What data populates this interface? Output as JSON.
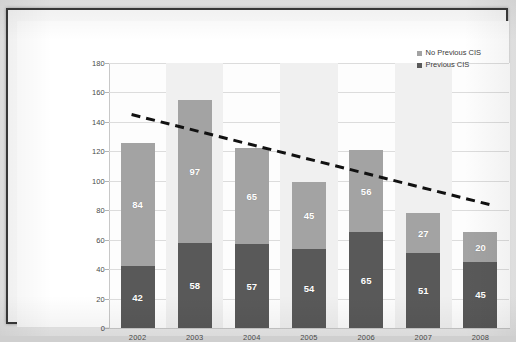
{
  "chart_data": {
    "type": "bar",
    "stacked": true,
    "title": "",
    "xlabel": "",
    "ylabel": "",
    "categories": [
      "2002",
      "2003",
      "2004",
      "2005",
      "2006",
      "2007",
      "2008"
    ],
    "series": [
      {
        "name": "Previous CIS",
        "color": "#595959",
        "values": [
          42,
          58,
          57,
          54,
          65,
          51,
          45
        ]
      },
      {
        "name": "No Previous CIS",
        "color": "#a3a3a3",
        "values": [
          84,
          97,
          65,
          45,
          56,
          27,
          20
        ]
      }
    ],
    "totals": [
      126,
      155,
      122,
      99,
      121,
      78,
      65
    ],
    "ylim": [
      0,
      180
    ],
    "ytick_values": [
      0,
      20,
      40,
      60,
      80,
      100,
      120,
      140,
      160,
      180
    ],
    "ytick_labels": [
      "0",
      "20",
      "40",
      "60",
      "80",
      "100",
      "120",
      "140",
      "160",
      "180"
    ],
    "grid": true,
    "legend_position": "top-right",
    "legend_entries": [
      "No Previous CIS",
      "Previous CIS"
    ],
    "trendline": {
      "style": "dashed",
      "color": "#111111",
      "start_value": 145,
      "end_value": 83,
      "start_category": "2002",
      "end_category": "2008"
    }
  },
  "legend": {
    "items": [
      {
        "label": "No Previous CIS",
        "swatch": "#a3a3a3"
      },
      {
        "label": "Previous CIS",
        "swatch": "#595959"
      }
    ]
  }
}
